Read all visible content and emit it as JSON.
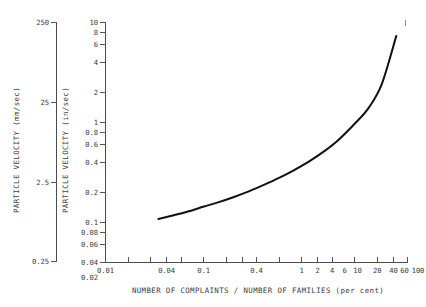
{
  "chart_data": {
    "type": "line",
    "title": "",
    "subtitle": "",
    "xlabel": "NUMBER OF COMPLAINTS / NUMBER OF FAMILIES (per cent)",
    "ylabel": "PARTICLE VELOCITY (in/sec)",
    "ylabel_secondary": "PARTICLE VELOCITY (mm/sec)",
    "xscale": "log",
    "yscale": "log",
    "xlim": [
      0.01,
      100
    ],
    "ylim": [
      0.01,
      10
    ],
    "ylim_secondary": [
      0.25,
      250
    ],
    "grid": false,
    "legend": false,
    "legend_position": "none",
    "xticks": [
      0.01,
      0.04,
      0.1,
      0.4,
      1,
      2,
      4,
      6,
      10,
      20,
      40,
      60,
      100
    ],
    "xticklabels": [
      "0.01",
      "0.04",
      "0.1",
      "0.4",
      "1",
      "2",
      "4",
      "6",
      "10",
      "20",
      "40",
      "60",
      "100"
    ],
    "yticks": [
      0.01,
      0.02,
      0.04,
      0.06,
      0.08,
      0.1,
      0.2,
      0.4,
      0.6,
      0.8,
      1,
      2,
      4,
      6,
      8,
      10
    ],
    "yticklabels": [
      "0.01",
      "0.02",
      "0.04",
      "0.06",
      "0.08",
      "0.1",
      "0.2",
      "0.4",
      "0.6",
      "0.8",
      "1",
      "2",
      "4",
      "6",
      "8",
      "10"
    ],
    "yticks_secondary": [
      0.25,
      2.5,
      25,
      250
    ],
    "yticklabels_secondary": [
      "0.25",
      "2.5",
      "25",
      "250"
    ],
    "series": [
      {
        "name": "complaint rate vs particle velocity",
        "x": [
          0.05,
          0.08,
          0.12,
          0.2,
          0.3,
          0.5,
          0.8,
          1.2,
          2.0,
          3.0,
          5.0,
          8.0,
          12.0,
          20.0,
          30.0,
          45.0,
          70.0
        ],
        "y": [
          0.035,
          0.039,
          0.043,
          0.05,
          0.056,
          0.066,
          0.078,
          0.092,
          0.115,
          0.14,
          0.185,
          0.25,
          0.34,
          0.55,
          0.85,
          1.7,
          6.8
        ]
      }
    ]
  },
  "axes": {
    "x_title": "NUMBER OF COMPLAINTS / NUMBER OF FAMILIES (per cent)",
    "y_inner_title": "PARTICLE VELOCITY (in/sec)",
    "y_outer_title": "PARTICLE VELOCITY (mm/sec)"
  }
}
